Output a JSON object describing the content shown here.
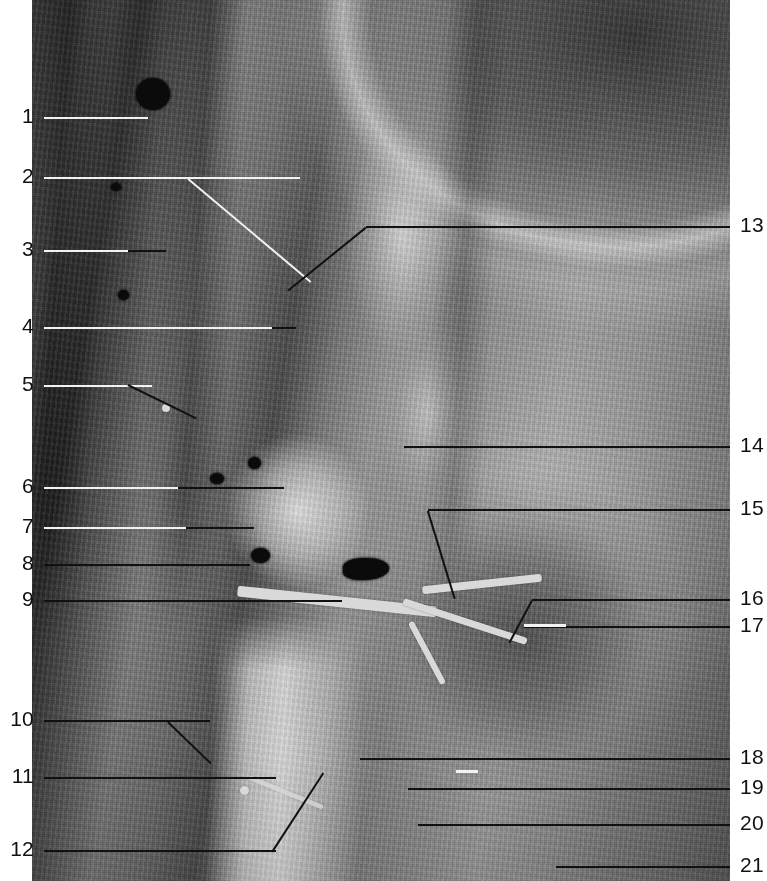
{
  "figure": {
    "kind": "anatomical-dissection-photograph",
    "region": "posterior abdominal wall, retroperitoneum, right kidney and renal hilum",
    "color_mode": "grayscale",
    "width": 767,
    "height": 881,
    "colors": {
      "background": "#ffffff",
      "label_text": "#111111",
      "leader_dark": "#111111",
      "leader_light": "#f2f2f2"
    }
  },
  "labels": {
    "left": [
      {
        "n": "1",
        "y": 110,
        "leader": "light"
      },
      {
        "n": "2",
        "y": 170,
        "leader": "light"
      },
      {
        "n": "3",
        "y": 243,
        "leader": "light"
      },
      {
        "n": "4",
        "y": 320,
        "leader": "light"
      },
      {
        "n": "5",
        "y": 378,
        "leader": "light"
      },
      {
        "n": "6",
        "y": 480,
        "leader": "light"
      },
      {
        "n": "7",
        "y": 520,
        "leader": "light"
      },
      {
        "n": "8",
        "y": 558,
        "leader": "dark"
      },
      {
        "n": "9",
        "y": 593,
        "leader": "dark"
      },
      {
        "n": "10",
        "y": 713,
        "leader": "dark"
      },
      {
        "n": "11",
        "y": 770,
        "leader": "dark"
      },
      {
        "n": "12",
        "y": 843,
        "leader": "dark"
      }
    ],
    "right": [
      {
        "n": "13",
        "y": 220,
        "leader": "dark"
      },
      {
        "n": "14",
        "y": 440,
        "leader": "dark"
      },
      {
        "n": "15",
        "y": 503,
        "leader": "dark"
      },
      {
        "n": "16",
        "y": 593,
        "leader": "dark"
      },
      {
        "n": "17",
        "y": 620,
        "leader": "dark"
      },
      {
        "n": "18",
        "y": 752,
        "leader": "dark"
      },
      {
        "n": "19",
        "y": 782,
        "leader": "dark"
      },
      {
        "n": "20",
        "y": 818,
        "leader": "dark"
      },
      {
        "n": "21",
        "y": 860,
        "leader": "dark"
      }
    ]
  }
}
